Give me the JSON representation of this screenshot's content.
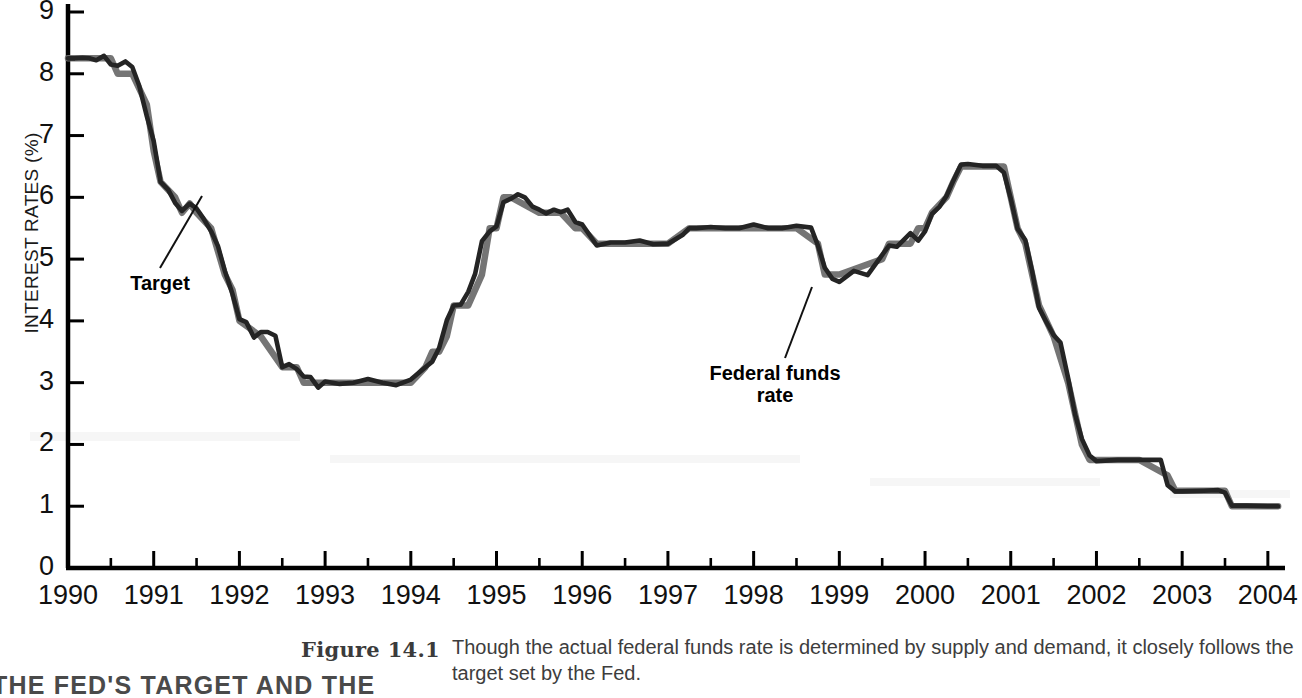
{
  "axes": {
    "y_title": "INTEREST RATES (%)",
    "y_ticks": [
      "0",
      "1",
      "2",
      "3",
      "4",
      "5",
      "6",
      "7",
      "8",
      "9"
    ],
    "x_ticks": [
      "1990",
      "1991",
      "1992",
      "1993",
      "1994",
      "1995",
      "1996",
      "1997",
      "1998",
      "1999",
      "2000",
      "2001",
      "2002",
      "2003",
      "2004"
    ]
  },
  "annotations": {
    "target": "Target",
    "federal_funds_rate": "Federal funds\nrate",
    "federal_funds_rate_line1": "Federal funds",
    "federal_funds_rate_line2": "rate"
  },
  "caption": {
    "figure_number": "Figure 14.1",
    "figure_heading": "THE FED'S TARGET AND THE",
    "text": "Though the actual federal funds rate is determined by supply and demand, it closely follows the target set by the Fed."
  },
  "colors": {
    "federal_funds_rate": "#242424",
    "target": "#6e6e6e",
    "axis": "#000000",
    "background": "#ffffff",
    "caption_text": "#3d3d3d"
  },
  "chart_data": {
    "type": "line",
    "xlabel": "",
    "ylabel": "INTEREST RATES (%)",
    "xlim": [
      1990.0,
      2004.2
    ],
    "ylim": [
      0,
      9
    ],
    "grid": false,
    "legend": "inline-annotations",
    "y_ticks": [
      0,
      1,
      2,
      3,
      4,
      5,
      6,
      7,
      8,
      9
    ],
    "x_ticks": [
      1990,
      1991,
      1992,
      1993,
      1994,
      1995,
      1996,
      1997,
      1998,
      1999,
      2000,
      2001,
      2002,
      2003,
      2004
    ],
    "x_minor_tick_interval": 0.5,
    "series": [
      {
        "name": "Federal funds rate",
        "color": "#242424",
        "x": [
          1990.0,
          1990.08,
          1990.17,
          1990.25,
          1990.33,
          1990.42,
          1990.5,
          1990.58,
          1990.67,
          1990.75,
          1990.83,
          1990.92,
          1991.0,
          1991.08,
          1991.17,
          1991.25,
          1991.33,
          1991.42,
          1991.5,
          1991.58,
          1991.67,
          1991.75,
          1991.83,
          1991.92,
          1992.0,
          1992.08,
          1992.17,
          1992.25,
          1992.33,
          1992.42,
          1992.5,
          1992.58,
          1992.67,
          1992.75,
          1992.83,
          1992.92,
          1993.0,
          1993.17,
          1993.33,
          1993.5,
          1993.67,
          1993.83,
          1994.0,
          1994.17,
          1994.25,
          1994.33,
          1994.42,
          1994.5,
          1994.58,
          1994.67,
          1994.75,
          1994.83,
          1994.92,
          1995.0,
          1995.08,
          1995.17,
          1995.25,
          1995.33,
          1995.42,
          1995.5,
          1995.58,
          1995.67,
          1995.75,
          1995.83,
          1995.92,
          1996.0,
          1996.17,
          1996.33,
          1996.5,
          1996.67,
          1996.83,
          1997.0,
          1997.17,
          1997.25,
          1997.33,
          1997.5,
          1997.67,
          1997.83,
          1998.0,
          1998.17,
          1998.33,
          1998.5,
          1998.67,
          1998.75,
          1998.83,
          1998.92,
          1999.0,
          1999.17,
          1999.33,
          1999.5,
          1999.58,
          1999.67,
          1999.83,
          1999.92,
          2000.0,
          2000.08,
          2000.17,
          2000.25,
          2000.33,
          2000.42,
          2000.5,
          2000.67,
          2000.83,
          2000.92,
          2001.0,
          2001.08,
          2001.17,
          2001.25,
          2001.33,
          2001.42,
          2001.5,
          2001.58,
          2001.67,
          2001.75,
          2001.83,
          2001.92,
          2002.0,
          2002.25,
          2002.5,
          2002.75,
          2002.83,
          2002.92,
          2003.0,
          2003.25,
          2003.42,
          2003.5,
          2003.58,
          2003.75,
          2004.0,
          2004.12
        ],
        "y": [
          8.25,
          8.25,
          8.26,
          8.25,
          8.22,
          8.29,
          8.15,
          8.13,
          8.2,
          8.11,
          7.81,
          7.31,
          6.91,
          6.25,
          6.12,
          5.91,
          5.78,
          5.9,
          5.82,
          5.66,
          5.45,
          5.21,
          4.81,
          4.43,
          4.03,
          3.98,
          3.73,
          3.82,
          3.82,
          3.76,
          3.25,
          3.3,
          3.22,
          3.1,
          3.09,
          2.92,
          3.02,
          2.98,
          3.0,
          3.06,
          3.0,
          2.96,
          3.05,
          3.25,
          3.34,
          3.56,
          4.01,
          4.25,
          4.26,
          4.47,
          4.76,
          5.29,
          5.45,
          5.53,
          5.92,
          5.98,
          6.05,
          6.0,
          5.85,
          5.8,
          5.74,
          5.8,
          5.76,
          5.8,
          5.6,
          5.56,
          5.22,
          5.27,
          5.27,
          5.3,
          5.24,
          5.25,
          5.39,
          5.5,
          5.5,
          5.52,
          5.5,
          5.5,
          5.56,
          5.5,
          5.5,
          5.54,
          5.51,
          5.22,
          4.86,
          4.68,
          4.63,
          4.81,
          4.74,
          5.07,
          5.22,
          5.2,
          5.42,
          5.3,
          5.45,
          5.73,
          5.85,
          6.02,
          6.27,
          6.53,
          6.54,
          6.51,
          6.51,
          6.4,
          5.98,
          5.49,
          5.31,
          4.8,
          4.21,
          3.97,
          3.77,
          3.65,
          3.07,
          2.49,
          2.09,
          1.82,
          1.73,
          1.75,
          1.75,
          1.75,
          1.34,
          1.24,
          1.24,
          1.25,
          1.26,
          1.22,
          1.01,
          1.01,
          1.0,
          1.0
        ]
      },
      {
        "name": "Target",
        "color": "#6e6e6e",
        "x": [
          1990.0,
          1990.5,
          1990.58,
          1990.75,
          1990.92,
          1991.0,
          1991.08,
          1991.25,
          1991.33,
          1991.42,
          1991.5,
          1991.67,
          1991.83,
          1991.92,
          1992.0,
          1992.25,
          1992.5,
          1992.67,
          1992.75,
          1992.92,
          1993.0,
          1993.5,
          1994.0,
          1994.17,
          1994.25,
          1994.33,
          1994.42,
          1994.5,
          1994.67,
          1994.83,
          1994.92,
          1995.0,
          1995.08,
          1995.17,
          1995.5,
          1995.58,
          1995.75,
          1995.92,
          1996.0,
          1996.17,
          1996.5,
          1997.0,
          1997.25,
          1997.5,
          1998.0,
          1998.5,
          1998.75,
          1998.83,
          1998.92,
          1999.0,
          1999.5,
          1999.58,
          1999.83,
          1999.92,
          2000.0,
          2000.08,
          2000.25,
          2000.33,
          2000.42,
          2000.5,
          2000.83,
          2000.92,
          2001.0,
          2001.08,
          2001.17,
          2001.25,
          2001.33,
          2001.5,
          2001.67,
          2001.75,
          2001.83,
          2001.92,
          2002.0,
          2002.5,
          2002.83,
          2002.92,
          2003.0,
          2003.5,
          2003.58,
          2004.0,
          2004.12
        ],
        "y": [
          8.25,
          8.25,
          8.0,
          8.0,
          7.5,
          6.75,
          6.25,
          6.0,
          5.75,
          5.9,
          5.75,
          5.5,
          4.75,
          4.5,
          4.0,
          3.75,
          3.25,
          3.25,
          3.0,
          3.0,
          3.0,
          3.0,
          3.0,
          3.25,
          3.5,
          3.5,
          3.75,
          4.25,
          4.25,
          4.75,
          5.5,
          5.5,
          6.0,
          6.0,
          5.75,
          5.75,
          5.75,
          5.5,
          5.5,
          5.25,
          5.25,
          5.25,
          5.5,
          5.5,
          5.5,
          5.5,
          5.25,
          4.75,
          4.75,
          4.75,
          5.0,
          5.25,
          5.25,
          5.5,
          5.5,
          5.75,
          6.0,
          6.25,
          6.5,
          6.5,
          6.5,
          6.5,
          6.0,
          5.5,
          5.25,
          4.75,
          4.25,
          3.75,
          3.0,
          2.5,
          2.0,
          1.75,
          1.75,
          1.75,
          1.5,
          1.25,
          1.25,
          1.25,
          1.0,
          1.0,
          1.0
        ]
      }
    ]
  }
}
